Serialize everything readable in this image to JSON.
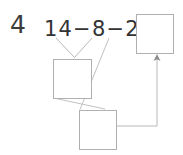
{
  "worksheet": {
    "problem_number": "4",
    "equation": "14−8−2=",
    "equation_parts": {
      "first_operand": "14",
      "operator_1": "−",
      "second_operand": "8",
      "operator_2": "−",
      "third_operand": "2",
      "equals": "="
    },
    "answer_boxes": [
      {
        "name": "result-box",
        "value": "",
        "position": "top-right"
      },
      {
        "name": "first-step-box",
        "value": "",
        "position": "middle-left"
      },
      {
        "name": "second-step-box",
        "value": "",
        "position": "bottom-center"
      }
    ],
    "connectors": [
      {
        "name": "bracket-from-14-and-8-to-first-step-box",
        "type": "v-bracket",
        "style": "thin-line"
      },
      {
        "name": "line-from-first-step-box-to-second-step-box",
        "type": "line",
        "style": "thin-line"
      },
      {
        "name": "line-from-2-to-second-step-box",
        "type": "line",
        "style": "thin-line"
      },
      {
        "name": "arrow-from-second-step-box-to-result-box",
        "type": "elbow-arrow",
        "style": "thin-line-with-arrowhead"
      }
    ],
    "colors": {
      "ink": "#333333",
      "number_ink": "#3c3c3c",
      "box_border": "#b0b0b0",
      "connector_line": "#b8b8b8",
      "arrow": "#8c8c8c",
      "background": "#ffffff"
    }
  }
}
